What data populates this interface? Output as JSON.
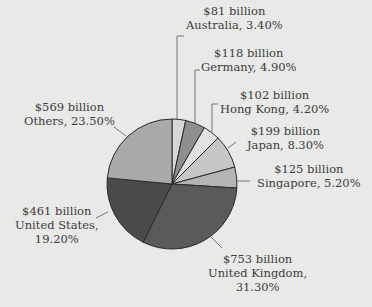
{
  "chart_data": {
    "type": "pie",
    "title": "",
    "unit": "billion USD",
    "categories": [
      "Australia",
      "Germany",
      "Hong Kong",
      "Japan",
      "Singapore",
      "United Kingdom",
      "United States",
      "Others"
    ],
    "values": [
      81,
      118,
      102,
      199,
      125,
      753,
      461,
      569
    ],
    "percentages": [
      3.4,
      4.9,
      4.2,
      8.3,
      5.2,
      31.3,
      19.2,
      23.5
    ],
    "slices": [
      {
        "name": "Australia",
        "value": 81,
        "value_label": "$81 billion",
        "pct_label": "Australia, 3.40%",
        "pct": 3.4,
        "color": "#d6d6d4"
      },
      {
        "name": "Germany",
        "value": 118,
        "value_label": "$118 billion",
        "pct_label": "Germany, 4.90%",
        "pct": 4.9,
        "color": "#8e8e8c"
      },
      {
        "name": "Hong Kong",
        "value": 102,
        "value_label": "$102 billion",
        "pct_label": "Hong Kong, 4.20%",
        "pct": 4.2,
        "color": "#e2e2e0"
      },
      {
        "name": "Japan",
        "value": 199,
        "value_label": "$199 billion",
        "pct_label": "Japan, 8.30%",
        "pct": 8.3,
        "color": "#c6c6c4"
      },
      {
        "name": "Singapore",
        "value": 125,
        "value_label": "$125 billion",
        "pct_label": "Singapore, 5.20%",
        "pct": 5.2,
        "color": "#b4b4b2"
      },
      {
        "name": "United Kingdom",
        "value": 753,
        "value_label": "$753 billion",
        "pct_label": "United Kingdom,",
        "pct_label2": "31.30%",
        "pct": 31.3,
        "color": "#5a5a58"
      },
      {
        "name": "United States",
        "value": 461,
        "value_label": "$461 billion",
        "pct_label": "United States,",
        "pct_label2": "19.20%",
        "pct": 19.2,
        "color": "#4a4a48"
      },
      {
        "name": "Others",
        "value": 569,
        "value_label": "$569 billion",
        "pct_label": "Others, 23.50%",
        "pct": 23.5,
        "color": "#a9a9a7"
      }
    ],
    "legend": "none",
    "labels": "external with leader lines"
  }
}
